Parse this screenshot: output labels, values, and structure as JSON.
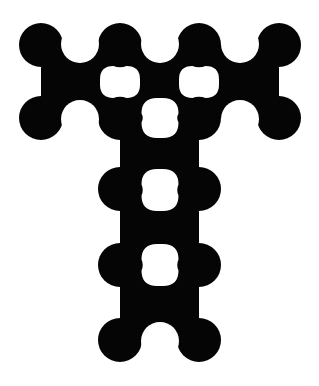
{
  "logo": {
    "description": "Letter T formed from a grid of connected circles (molecule / metaball style)",
    "letter": "T",
    "colors": {
      "ink": "#050505",
      "background": "#ffffff"
    },
    "circle_radius": 22,
    "circles": [
      {
        "x": 41,
        "y": 45
      },
      {
        "x": 120,
        "y": 45
      },
      {
        "x": 199,
        "y": 45
      },
      {
        "x": 279,
        "y": 45
      },
      {
        "x": 41,
        "y": 118
      },
      {
        "x": 120,
        "y": 118
      },
      {
        "x": 199,
        "y": 118
      },
      {
        "x": 279,
        "y": 118
      },
      {
        "x": 120,
        "y": 189
      },
      {
        "x": 199,
        "y": 189
      },
      {
        "x": 120,
        "y": 265
      },
      {
        "x": 199,
        "y": 265
      },
      {
        "x": 120,
        "y": 340
      },
      {
        "x": 199,
        "y": 340
      }
    ],
    "junctions": [
      {
        "x1": 41,
        "y1": 45,
        "x2": 120,
        "y2": 118
      },
      {
        "x1": 120,
        "y1": 45,
        "x2": 199,
        "y2": 118
      },
      {
        "x1": 199,
        "y1": 45,
        "x2": 279,
        "y2": 118
      },
      {
        "x1": 120,
        "y1": 118,
        "x2": 199,
        "y2": 189
      },
      {
        "x1": 120,
        "y1": 189,
        "x2": 199,
        "y2": 265
      },
      {
        "x1": 120,
        "y1": 265,
        "x2": 199,
        "y2": 340
      }
    ],
    "holes": [
      {
        "x": 120,
        "y": 82,
        "w": 40,
        "h": 32,
        "orient": "h"
      },
      {
        "x": 199,
        "y": 82,
        "w": 40,
        "h": 32,
        "orient": "h"
      },
      {
        "x": 160,
        "y": 118,
        "w": 37,
        "h": 40,
        "orient": "v"
      },
      {
        "x": 160,
        "y": 190,
        "w": 37,
        "h": 42,
        "orient": "v"
      },
      {
        "x": 160,
        "y": 265,
        "w": 37,
        "h": 42,
        "orient": "v"
      }
    ],
    "notches": [
      {
        "x": 80,
        "y": 44,
        "r": 19
      },
      {
        "x": 160,
        "y": 44,
        "r": 19
      },
      {
        "x": 240,
        "y": 44,
        "r": 19
      },
      {
        "x": 80,
        "y": 119,
        "r": 19
      },
      {
        "x": 240,
        "y": 119,
        "r": 19
      },
      {
        "x": 4,
        "y": 82,
        "r": 19
      },
      {
        "x": 316,
        "y": 82,
        "r": 19
      },
      {
        "x": 83,
        "y": 153,
        "r": 19
      },
      {
        "x": 236,
        "y": 153,
        "r": 19
      },
      {
        "x": 83,
        "y": 228,
        "r": 19
      },
      {
        "x": 236,
        "y": 228,
        "r": 19
      },
      {
        "x": 83,
        "y": 303,
        "r": 19
      },
      {
        "x": 236,
        "y": 303,
        "r": 19
      },
      {
        "x": 160,
        "y": 341,
        "r": 19
      }
    ]
  }
}
